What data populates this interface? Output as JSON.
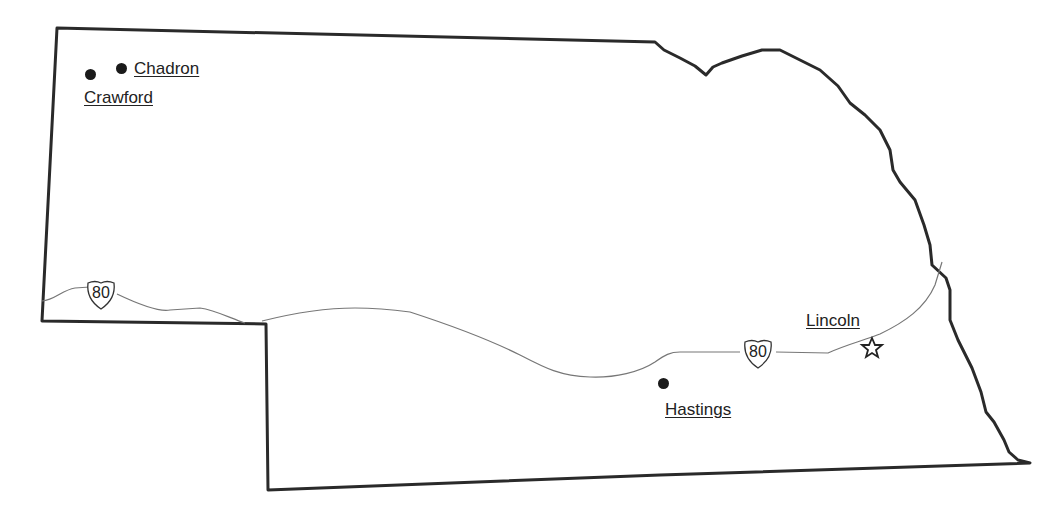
{
  "map": {
    "region": "Nebraska",
    "colors": {
      "border": "#2a2a2a",
      "highway": "#777777",
      "marker": "#1a1a1a",
      "background": "#ffffff"
    }
  },
  "cities": [
    {
      "name": "Chadron",
      "marker": "dot"
    },
    {
      "name": "Crawford",
      "marker": "dot"
    },
    {
      "name": "Hastings",
      "marker": "dot"
    },
    {
      "name": "Lincoln",
      "marker": "star",
      "capital": true
    }
  ],
  "highways": [
    {
      "route": "80",
      "type": "interstate-shield"
    },
    {
      "route": "80",
      "type": "interstate-shield"
    }
  ]
}
